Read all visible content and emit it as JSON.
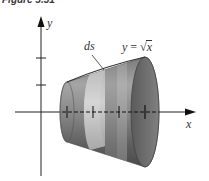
{
  "figure": {
    "caption": "Figure 5.31",
    "axes": {
      "x_label": "x",
      "y_label": "y"
    },
    "curve_label": {
      "lhs": "y",
      "eq": "=",
      "radical": "√",
      "arg": "x"
    },
    "element_label": "ds",
    "x_ticks": 4,
    "y_ticks": 2,
    "colors": {
      "surface_dark": "#5a5a5a",
      "surface_mid": "#8c8c8c",
      "surface_light": "#b8b8b8",
      "band": "#c9c9c9",
      "interior": "#6e6e6e",
      "axis": "#222222"
    }
  }
}
